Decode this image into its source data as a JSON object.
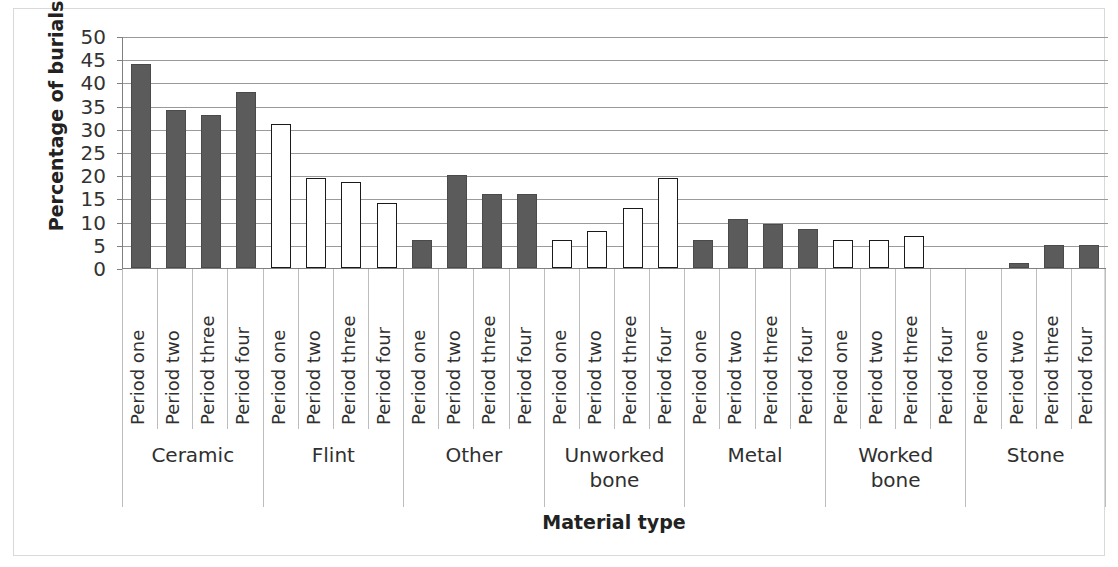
{
  "chart_data": {
    "type": "bar",
    "title": "",
    "xlabel": "Material type",
    "ylabel": "Percentage of burials",
    "ylim": [
      0,
      50
    ],
    "yticks": [
      0,
      5,
      10,
      15,
      20,
      25,
      30,
      35,
      40,
      45,
      50
    ],
    "grid": true,
    "legend": "none",
    "categories": [
      "Ceramic",
      "Flint",
      "Other",
      "Unworked bone",
      "Metal",
      "Worked bone",
      "Stone"
    ],
    "periods": [
      "Period one",
      "Period two",
      "Period three",
      "Period four"
    ],
    "groups": [
      {
        "name": "Ceramic",
        "style": "filled",
        "values": [
          44,
          34,
          33,
          38
        ]
      },
      {
        "name": "Flint",
        "style": "open",
        "values": [
          31,
          19.5,
          18.5,
          14
        ]
      },
      {
        "name": "Other",
        "style": "filled",
        "values": [
          6,
          20,
          16,
          16
        ]
      },
      {
        "name": "Unworked bone",
        "style": "open",
        "values": [
          6,
          8,
          13,
          19.5
        ]
      },
      {
        "name": "Metal",
        "style": "filled",
        "values": [
          6,
          10.5,
          9.5,
          8.5
        ]
      },
      {
        "name": "Worked bone",
        "style": "open",
        "values": [
          6,
          6,
          7,
          0
        ]
      },
      {
        "name": "Stone",
        "style": "filled",
        "values": [
          0,
          1,
          5,
          5
        ]
      }
    ],
    "series": [
      {
        "name": "Period one",
        "values": [
          44,
          31,
          6,
          6,
          6,
          6,
          0
        ]
      },
      {
        "name": "Period two",
        "values": [
          34,
          19.5,
          20,
          8,
          10.5,
          6,
          1
        ]
      },
      {
        "name": "Period three",
        "values": [
          33,
          18.5,
          16,
          13,
          9.5,
          7,
          5
        ]
      },
      {
        "name": "Period four",
        "values": [
          38,
          14,
          16,
          19.5,
          8.5,
          0,
          5
        ]
      }
    ],
    "colors": {
      "filled_bar": "#5b5b5b",
      "open_bar": "#ffffff",
      "bar_outline": "#1a1a1a",
      "gridline": "#9a9a9a",
      "axis": "#808080",
      "frame": "#d9d9d9",
      "text": "#303030"
    }
  }
}
